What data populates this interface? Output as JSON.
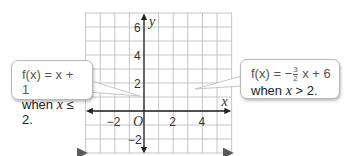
{
  "chart_data": {
    "type": "line",
    "title": "",
    "xlabel": "x",
    "ylabel": "y",
    "xlim": [
      -4,
      6
    ],
    "ylim": [
      -3,
      7
    ],
    "grid": true,
    "x_ticks": [
      -2,
      2,
      4
    ],
    "y_ticks": [
      6,
      4,
      2,
      -2
    ],
    "origin_label": "O",
    "series": [
      {
        "name": "f(x) = x + 1 when x ≤ 2",
        "x": [
          -4,
          2
        ],
        "y": [
          -3,
          3
        ]
      },
      {
        "name": "f(x) = -3/2 x + 6 when x > 2",
        "x": [
          2,
          6
        ],
        "y": [
          3,
          -3
        ]
      }
    ],
    "annotations": [
      {
        "text": "f(x) = x + 1 when x ≤ 2.",
        "points_to": [
          0,
          1
        ]
      },
      {
        "text": "f(x) = −3/2 x + 6 when x > 2.",
        "points_to": [
          3.5,
          0.75
        ]
      }
    ]
  },
  "callouts": {
    "left": {
      "fn_prefix": "f(x) = x + 1",
      "cond_word": "when ",
      "cond_var": "x",
      "cond_rest": " ≤ 2."
    },
    "right": {
      "fn_prefix": "f(x) = −",
      "frac_num": "3",
      "frac_den": "2",
      "fn_suffix": " x + 6",
      "cond_word": "when ",
      "cond_var": "x",
      "cond_rest": " > 2."
    }
  },
  "colors": {
    "line": "#5a5a5a",
    "grid": "#b8b8b8",
    "axis": "#222222"
  }
}
